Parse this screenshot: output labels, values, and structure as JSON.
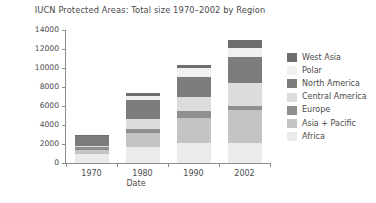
{
  "chart_data": {
    "type": "bar",
    "stacked": true,
    "title": "IUCN Protected Areas: Total size 1970–2002 by Region",
    "xlabel": "Date",
    "ylabel": "Thousands of km",
    "ylabel_sup": "2",
    "categories": [
      "1970",
      "1980",
      "1990",
      "2002"
    ],
    "ylim": [
      0,
      14000
    ],
    "yticks": [
      "0",
      "2000",
      "4000",
      "6000",
      "8000",
      "10000",
      "12000",
      "14000"
    ],
    "ytick_values": [
      0,
      2000,
      4000,
      6000,
      8000,
      10000,
      12000,
      14000
    ],
    "grid": false,
    "legend_position": "right",
    "series": [
      {
        "name": "Africa",
        "color": "#ebebeb",
        "values": [
          900,
          1700,
          2100,
          2100
        ]
      },
      {
        "name": "Asia + Pacific",
        "color": "#c4c4c4",
        "values": [
          500,
          1500,
          2600,
          3500
        ]
      },
      {
        "name": "Europe",
        "color": "#8f8f8f",
        "values": [
          250,
          400,
          800,
          400
        ]
      },
      {
        "name": "Central America",
        "color": "#dcdcdc",
        "values": [
          100,
          1000,
          1500,
          2400
        ]
      },
      {
        "name": "North America",
        "color": "#7c7c7c",
        "values": [
          1050,
          2000,
          2100,
          2800
        ]
      },
      {
        "name": "Polar",
        "color": "#f0f0f0",
        "values": [
          50,
          500,
          900,
          900
        ]
      },
      {
        "name": "West Asia",
        "color": "#6e6e6e",
        "values": [
          50,
          300,
          300,
          900
        ]
      }
    ],
    "totals": [
      2900,
      7400,
      10300,
      13000
    ],
    "stack_order_bottom_to_top": [
      "Africa",
      "Asia + Pacific",
      "Europe",
      "Central America",
      "North America",
      "Polar",
      "West Asia"
    ]
  },
  "legend": {
    "items": [
      {
        "label": "West Asia",
        "color": "#6e6e6e"
      },
      {
        "label": "Polar",
        "color": "#f0f0f0"
      },
      {
        "label": "North America",
        "color": "#7c7c7c"
      },
      {
        "label": "Central America",
        "color": "#dcdcdc"
      },
      {
        "label": "Europe",
        "color": "#8f8f8f"
      },
      {
        "label": "Asia + Pacific",
        "color": "#c4c4c4"
      },
      {
        "label": "Africa",
        "color": "#ebebeb"
      }
    ]
  },
  "colors": {
    "background": "#ffffff",
    "axis": "#8d8d8d",
    "text": "#4a4a4a"
  }
}
